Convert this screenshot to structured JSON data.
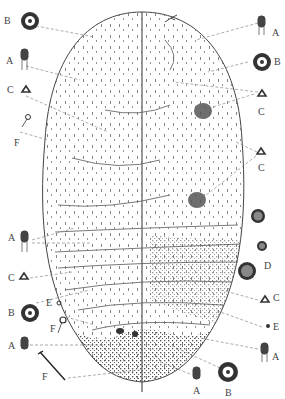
{
  "figure": {
    "ink_color": "#333333",
    "leader_color": "#777777"
  },
  "labels": [
    {
      "id": "B1",
      "text": "B",
      "x": 4,
      "y": 13
    },
    {
      "id": "A1",
      "text": "A",
      "x": 6,
      "y": 56
    },
    {
      "id": "C1",
      "text": "C",
      "x": 7,
      "y": 89
    },
    {
      "id": "F1",
      "text": "F",
      "x": 14,
      "y": 142
    },
    {
      "id": "A2",
      "text": "A",
      "x": 272,
      "y": 31
    },
    {
      "id": "B2",
      "text": "B",
      "x": 272,
      "y": 60
    },
    {
      "id": "C2",
      "text": "C",
      "x": 258,
      "y": 106
    },
    {
      "id": "C3",
      "text": "C",
      "x": 258,
      "y": 163
    },
    {
      "id": "D1",
      "text": "D",
      "x": 265,
      "y": 264
    },
    {
      "id": "A3",
      "text": "A",
      "x": 12,
      "y": 235
    },
    {
      "id": "C4",
      "text": "C",
      "x": 10,
      "y": 276
    },
    {
      "id": "B3",
      "text": "B",
      "x": 10,
      "y": 309
    },
    {
      "id": "E1",
      "text": "E",
      "x": 46,
      "y": 304
    },
    {
      "id": "F2",
      "text": "F",
      "x": 50,
      "y": 323
    },
    {
      "id": "A4",
      "text": "A",
      "x": 10,
      "y": 346
    },
    {
      "id": "F3",
      "text": "F",
      "x": 42,
      "y": 371
    },
    {
      "id": "C5",
      "text": "C",
      "x": 273,
      "y": 294
    },
    {
      "id": "E2",
      "text": "E",
      "x": 273,
      "y": 325
    },
    {
      "id": "A5",
      "text": "A",
      "x": 272,
      "y": 355
    },
    {
      "id": "A6",
      "text": "A",
      "x": 193,
      "y": 390
    },
    {
      "id": "B4",
      "text": "B",
      "x": 228,
      "y": 390
    }
  ]
}
